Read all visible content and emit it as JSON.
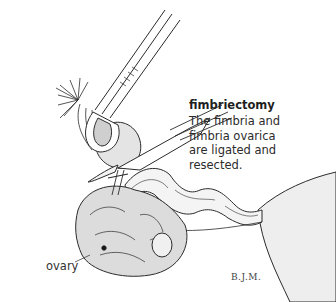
{
  "figure": {
    "title": "fimbriectomy",
    "caption_lines": [
      "The fimbria and",
      "fimbria ovarica",
      "are ligated and",
      "resected."
    ],
    "labels": {
      "ovary": "ovary"
    },
    "signature": "B.J.M.",
    "colors": {
      "ink": "#2b2b2b",
      "shading": "#e8e8e8",
      "background": "#ffffff"
    },
    "depicted_items": [
      "forceps-clamp",
      "scissors",
      "fimbria",
      "fallopian-tube",
      "ligature",
      "ovary",
      "uterus"
    ]
  }
}
